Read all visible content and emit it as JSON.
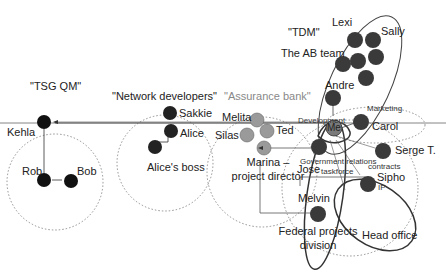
{
  "groups": {
    "tsg_qm": "\"TSG QM\"",
    "network_developers": "\"Network developers\"",
    "assurance_bank": "\"Assurance bank\"",
    "tdm": "\"TDM\""
  },
  "people": {
    "kehla": "Kehla",
    "rob": "Rob",
    "bob": "Bob",
    "sakkie": "Sakkie",
    "alice": "Alice",
    "alices_boss": "Alice's boss",
    "melita": "Melita",
    "silas": "Silas",
    "ted": "Ted",
    "marina_line1": "Marina –",
    "marina_line2": "project director",
    "lexi": "Lexi",
    "sally": "Sally",
    "ab_team": "The AB team",
    "andre": "Andre",
    "me": "Me",
    "carol": "Carol",
    "serge": "Serge T.",
    "jose": "Jose",
    "sipho": "Sipho",
    "melvin": "Melvin"
  },
  "annotations": {
    "development": "Development",
    "marketing": "Marketing",
    "gov_relations": "Government relations",
    "taskforce": "taskforce",
    "contracts": "contracts",
    "federal_line1": "Federal projects",
    "federal_line2": "division",
    "head_office": "Head office",
    "ip": "IP"
  },
  "colors": {
    "dark_node": "#3a3a3a",
    "black_node": "#111111",
    "grey_node": "#9a9a9a",
    "line": "#555555"
  }
}
